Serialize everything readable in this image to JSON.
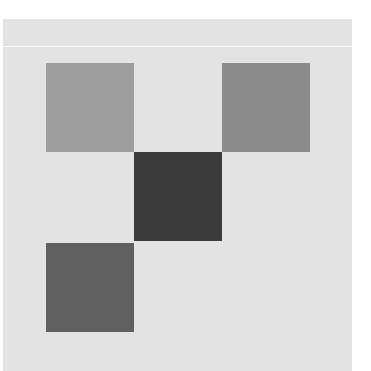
{
  "board": {
    "background_color": "#e3e3e3",
    "divider_color": "#f8f8f8",
    "grid": {
      "rows": 3,
      "cols": 3,
      "cell_size_px": 88
    },
    "tiles": [
      {
        "row": 0,
        "col": 0,
        "color": "#9e9e9e",
        "label": ""
      },
      {
        "row": 0,
        "col": 2,
        "color": "#8b8b8b",
        "label": ""
      },
      {
        "row": 1,
        "col": 1,
        "color": "#3b3b3b",
        "label": ""
      },
      {
        "row": 2,
        "col": 0,
        "color": "#5f5f5f",
        "label": ""
      }
    ]
  }
}
